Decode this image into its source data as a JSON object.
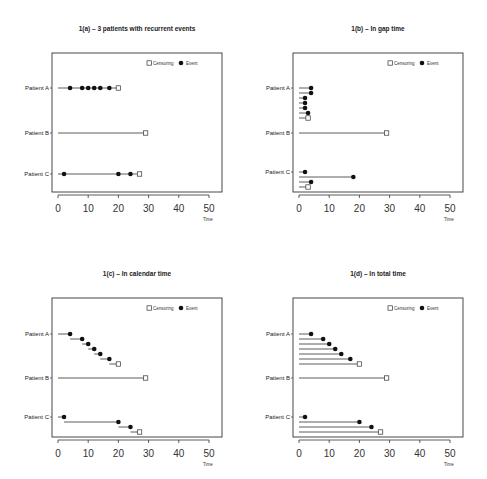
{
  "legend": {
    "censoring_label": "Censoring",
    "event_label": "Event"
  },
  "axis": {
    "xlabel": "Time",
    "ticks": [
      0,
      10,
      20,
      30,
      40,
      50
    ]
  },
  "patients": [
    "Patient A",
    "Patient B",
    "Patient C"
  ],
  "chart_data": [
    {
      "type": "line",
      "title": "1(a) – 3 patients with recurrent events",
      "xlabel": "Time",
      "xlim": [
        0,
        50
      ],
      "grid": false,
      "legend_position": "top-right",
      "layout": "single-line-per-patient",
      "series": [
        {
          "name": "Patient A",
          "segments": [
            {
              "start": 0,
              "end": 20,
              "events": [
                4,
                8,
                10,
                12,
                14,
                17
              ],
              "censor": 20
            }
          ]
        },
        {
          "name": "Patient B",
          "segments": [
            {
              "start": 0,
              "end": 29,
              "events": [],
              "censor": 29
            }
          ]
        },
        {
          "name": "Patient C",
          "segments": [
            {
              "start": 0,
              "end": 27,
              "events": [
                2,
                20,
                24
              ],
              "censor": 27
            }
          ]
        }
      ]
    },
    {
      "type": "line",
      "title": "1(b) – In gap time",
      "xlabel": "Time",
      "xlim": [
        0,
        50
      ],
      "grid": false,
      "legend_position": "top-right",
      "layout": "gap-time",
      "series": [
        {
          "name": "Patient A",
          "segments": [
            {
              "start": 0,
              "end": 4,
              "type": "event"
            },
            {
              "start": 0,
              "end": 4,
              "type": "event"
            },
            {
              "start": 0,
              "end": 2,
              "type": "event"
            },
            {
              "start": 0,
              "end": 2,
              "type": "event"
            },
            {
              "start": 0,
              "end": 2,
              "type": "event"
            },
            {
              "start": 0,
              "end": 3,
              "type": "event"
            },
            {
              "start": 0,
              "end": 3,
              "type": "censor"
            }
          ]
        },
        {
          "name": "Patient B",
          "segments": [
            {
              "start": 0,
              "end": 29,
              "type": "censor"
            }
          ]
        },
        {
          "name": "Patient C",
          "segments": [
            {
              "start": 0,
              "end": 2,
              "type": "event"
            },
            {
              "start": 0,
              "end": 18,
              "type": "event"
            },
            {
              "start": 0,
              "end": 4,
              "type": "event"
            },
            {
              "start": 0,
              "end": 3,
              "type": "censor"
            }
          ]
        }
      ]
    },
    {
      "type": "line",
      "title": "1(c) – In calendar time",
      "xlabel": "Time",
      "xlim": [
        0,
        50
      ],
      "grid": false,
      "legend_position": "top-right",
      "layout": "calendar-time",
      "series": [
        {
          "name": "Patient A",
          "segments": [
            {
              "start": 0,
              "end": 4,
              "type": "event"
            },
            {
              "start": 4,
              "end": 8,
              "type": "event"
            },
            {
              "start": 8,
              "end": 10,
              "type": "event"
            },
            {
              "start": 10,
              "end": 12,
              "type": "event"
            },
            {
              "start": 12,
              "end": 14,
              "type": "event"
            },
            {
              "start": 14,
              "end": 17,
              "type": "event"
            },
            {
              "start": 17,
              "end": 20,
              "type": "censor"
            }
          ]
        },
        {
          "name": "Patient B",
          "segments": [
            {
              "start": 0,
              "end": 29,
              "type": "censor"
            }
          ]
        },
        {
          "name": "Patient C",
          "segments": [
            {
              "start": 0,
              "end": 2,
              "type": "event"
            },
            {
              "start": 2,
              "end": 20,
              "type": "event"
            },
            {
              "start": 20,
              "end": 24,
              "type": "event"
            },
            {
              "start": 24,
              "end": 27,
              "type": "censor"
            }
          ]
        }
      ]
    },
    {
      "type": "line",
      "title": "1(d) – In total time",
      "xlabel": "Time",
      "xlim": [
        0,
        50
      ],
      "grid": false,
      "legend_position": "top-right",
      "layout": "total-time",
      "series": [
        {
          "name": "Patient A",
          "segments": [
            {
              "start": 0,
              "end": 4,
              "type": "event"
            },
            {
              "start": 0,
              "end": 8,
              "type": "event"
            },
            {
              "start": 0,
              "end": 10,
              "type": "event"
            },
            {
              "start": 0,
              "end": 12,
              "type": "event"
            },
            {
              "start": 0,
              "end": 14,
              "type": "event"
            },
            {
              "start": 0,
              "end": 17,
              "type": "event"
            },
            {
              "start": 0,
              "end": 20,
              "type": "censor"
            }
          ]
        },
        {
          "name": "Patient B",
          "segments": [
            {
              "start": 0,
              "end": 29,
              "type": "censor"
            }
          ]
        },
        {
          "name": "Patient C",
          "segments": [
            {
              "start": 0,
              "end": 2,
              "type": "event"
            },
            {
              "start": 0,
              "end": 20,
              "type": "event"
            },
            {
              "start": 0,
              "end": 24,
              "type": "event"
            },
            {
              "start": 0,
              "end": 27,
              "type": "censor"
            }
          ]
        }
      ]
    }
  ]
}
